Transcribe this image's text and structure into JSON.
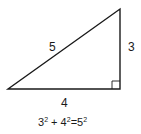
{
  "diagram": {
    "type": "right-triangle",
    "sides": {
      "hypotenuse": "5",
      "vertical_leg": "3",
      "horizontal_leg": "4"
    },
    "equation": {
      "a": "3",
      "b": "4",
      "c": "5",
      "exp": "2",
      "plus": "+",
      "equals": "="
    },
    "colors": {
      "stroke": "#1a1a1a",
      "background": "#ffffff"
    }
  }
}
